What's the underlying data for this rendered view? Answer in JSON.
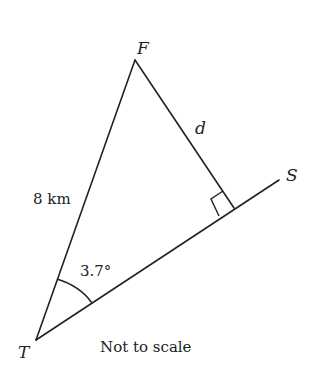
{
  "diagram": {
    "type": "right-triangle geometry",
    "points": {
      "F": {
        "label": "F",
        "x": 135,
        "y": 60
      },
      "T": {
        "label": "T",
        "x": 36,
        "y": 340
      },
      "S": {
        "label": "S",
        "x": 279,
        "y": 180
      },
      "foot": {
        "x": 234,
        "y": 208
      }
    },
    "labels": {
      "vertex_f": "F",
      "vertex_t": "T",
      "vertex_s": "S",
      "side_tf": "8 km",
      "side_d": "d",
      "angle_t": "3.7°",
      "note": "Not to scale"
    },
    "colors": {
      "line": "#222222",
      "background": "#ffffff"
    }
  }
}
